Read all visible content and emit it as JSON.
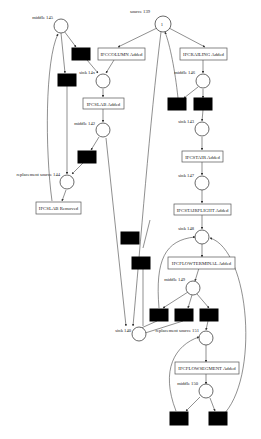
{
  "diagram": {
    "type": "petri-net",
    "places": [
      {
        "id": "source_139",
        "label": "source 139",
        "token": "1"
      },
      {
        "id": "middle_145",
        "label": "middle 145"
      },
      {
        "id": "sink_14x",
        "label": "sink 14x"
      },
      {
        "id": "middle_142",
        "label": "middle 142"
      },
      {
        "id": "replacement_source_144",
        "label": "replacement source 144"
      },
      {
        "id": "middle_146",
        "label": "middle 146"
      },
      {
        "id": "sink_143",
        "label": "sink 143"
      },
      {
        "id": "sink_147",
        "label": "sink 147"
      },
      {
        "id": "sink_148",
        "label": "sink 148"
      },
      {
        "id": "middle_149",
        "label": "middle 149"
      },
      {
        "id": "sink_140",
        "label": "sink 140"
      },
      {
        "id": "replacement_source_151",
        "label": "replacement source 151"
      },
      {
        "id": "middle_150",
        "label": "middle 150"
      }
    ],
    "transitions": [
      {
        "id": "t_ifccolumn",
        "label": "IFCCOLUMN Added"
      },
      {
        "id": "t_ifcrailing",
        "label": "IFCRAILING Added"
      },
      {
        "id": "t_ifcslab_added",
        "label": "IFCSLAB Added"
      },
      {
        "id": "t_ifcslab_removed",
        "label": "IFCSLAB Removed"
      },
      {
        "id": "t_ifcstair",
        "label": "IFCSTAIR Added"
      },
      {
        "id": "t_ifcstairflight",
        "label": "IFCSTAIRFLIGHT Added"
      },
      {
        "id": "t_ifcflowterminal",
        "label": "IFCFLOWTERMINAL Added"
      },
      {
        "id": "t_ifcflowsegment",
        "label": "IFCFLOWSEGMENT Added"
      }
    ],
    "silent_transitions_count": 11
  }
}
